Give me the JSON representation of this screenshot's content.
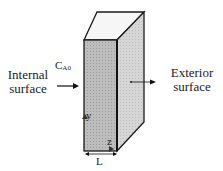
{
  "diagram": {
    "type": "slab-membrane-3d",
    "labels": {
      "internal": [
        "Internal",
        "surface"
      ],
      "exterior": [
        "Exterior",
        "surface"
      ],
      "concentration_main": "C",
      "concentration_sub": "A0",
      "axis_y": "y",
      "axis_z": "z",
      "thickness": "L"
    },
    "colors": {
      "front_face": "#b8b8b8",
      "side_face": "#d2d2d2",
      "top_face": "#f4f4f4",
      "stroke": "#1a1a1a"
    }
  }
}
